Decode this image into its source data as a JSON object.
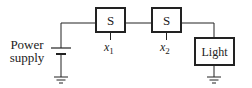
{
  "diagram": {
    "type": "circuit",
    "power_supply": {
      "label_line1": "Power",
      "label_line2": "supply"
    },
    "switches": [
      {
        "label": "S",
        "input": "x",
        "input_sub": "1"
      },
      {
        "label": "S",
        "input": "x",
        "input_sub": "2"
      }
    ],
    "load": {
      "label": "Light"
    },
    "colors": {
      "stroke": "#222222",
      "background": "#ffffff"
    }
  }
}
